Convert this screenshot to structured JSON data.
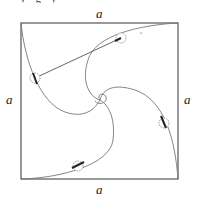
{
  "figure": {
    "clipped_caption": "· · · y · g · y · · · · · · · · · · · · · · · · ·",
    "side_labels": {
      "top": "a",
      "bottom": "a",
      "left": "a",
      "right": "a"
    },
    "square": {
      "x0": 21,
      "y0": 23,
      "x1": 178,
      "y1": 179
    },
    "bugs": [
      {
        "id": "bug-top",
        "x": 121,
        "y": 38
      },
      {
        "id": "bug-left",
        "x": 35,
        "y": 78
      },
      {
        "id": "bug-right",
        "x": 164,
        "y": 123
      },
      {
        "id": "bug-bottom",
        "x": 78,
        "y": 165
      }
    ],
    "small_mark": "a",
    "colors": {
      "stroke": "#555555",
      "curve": "#777777",
      "bug": "#999999"
    }
  }
}
